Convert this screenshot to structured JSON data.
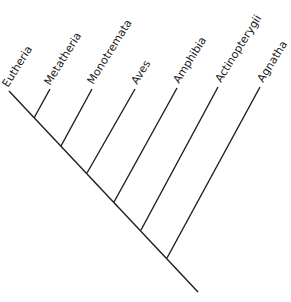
{
  "diagram": {
    "type": "cladogram",
    "line_color": "#1e1e1e",
    "text_color": "#1a1a1a",
    "label_angle_deg": -58,
    "backbone": {
      "start": [
        9,
        91
      ],
      "end": [
        198,
        292
      ]
    },
    "taxa": [
      {
        "name": "Eutheria",
        "tip": [
          9,
          91
        ],
        "join": [
          34,
          118
        ],
        "label_anchor": [
          8,
          88
        ]
      },
      {
        "name": "Metatheria",
        "tip": [
          50,
          89
        ],
        "join": [
          34,
          118
        ],
        "label_anchor": [
          50,
          86
        ]
      },
      {
        "name": "Monotremata",
        "tip": [
          92,
          89
        ],
        "join": [
          61,
          146
        ],
        "label_anchor": [
          93,
          85
        ]
      },
      {
        "name": "Aves",
        "tip": [
          135,
          89
        ],
        "join": [
          87,
          173
        ],
        "label_anchor": [
          137,
          85
        ]
      },
      {
        "name": "Amphibia",
        "tip": [
          177,
          88
        ],
        "join": [
          114,
          202
        ],
        "label_anchor": [
          179,
          84
        ]
      },
      {
        "name": "Actinopterygii",
        "tip": [
          218,
          87
        ],
        "join": [
          141,
          230
        ],
        "label_anchor": [
          221,
          83
        ]
      },
      {
        "name": "Agnatha",
        "tip": [
          260,
          87
        ],
        "join": [
          167,
          258
        ],
        "label_anchor": [
          263,
          83
        ]
      }
    ]
  }
}
